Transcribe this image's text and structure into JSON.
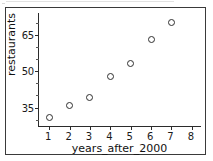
{
  "chart_data": {
    "type": "scatter",
    "title": "",
    "xlabel": "years_after_2000",
    "ylabel": "restaurants",
    "x": [
      1,
      2,
      3,
      4,
      5,
      6,
      7
    ],
    "values": [
      31,
      36,
      39,
      48,
      53,
      63,
      70
    ],
    "series": [
      {
        "name": "restaurants",
        "x": [
          1,
          2,
          3,
          4,
          5,
          6,
          7
        ],
        "values": [
          31,
          36,
          39,
          48,
          53,
          63,
          70
        ]
      }
    ],
    "xlim": [
      0.5,
      8.5
    ],
    "ylim": [
      27,
      74
    ],
    "xticks": [
      1,
      2,
      3,
      4,
      5,
      6,
      7,
      8
    ],
    "xtick_labels": [
      "1",
      "2",
      "3",
      "4",
      "5",
      "6",
      "7",
      "8"
    ],
    "yticks": [
      35,
      50,
      65
    ],
    "ytick_labels": [
      "35",
      "50",
      "65"
    ],
    "yminor_ticks": [
      30,
      40,
      45,
      55,
      60,
      70
    ],
    "grid": false,
    "legend": null,
    "marker": "open-circle",
    "marker_color": "#2f2f2f"
  },
  "colors": {
    "axis": "#2b2b2b",
    "border": "#3a3a3a",
    "text": "#111111",
    "marker": "#2f2f2f",
    "background": "#ffffff"
  }
}
